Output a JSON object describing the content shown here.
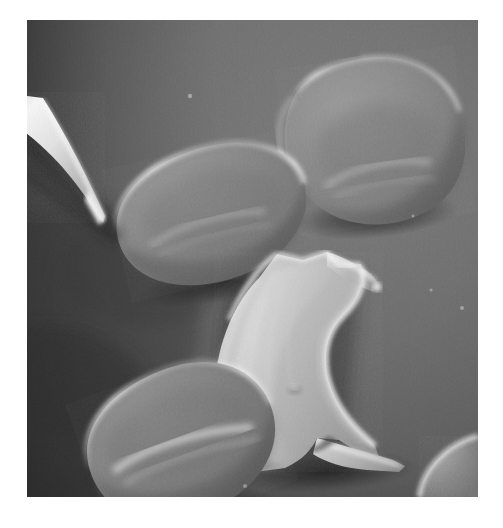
{
  "image": {
    "kind": "scanning-electron-micrograph",
    "subject": "human red blood cells with one sickled erythrocyte",
    "background_color": "#6e6e6e",
    "page_background": "#ffffff",
    "plate": {
      "left": 27,
      "top": 20,
      "width": 451,
      "height": 477
    },
    "tone": {
      "background_light": "#7a7a7a",
      "background_mid": "#6a6a6a",
      "background_dark": "#3a3a3a",
      "cell_mid": "#8a8a8a",
      "cell_highlight": "#d8d8d8",
      "cell_shadow": "#3c3c3c",
      "sickle_body": "#b8b8b8",
      "sickle_highlight": "#ededed",
      "probe_highlight": "#f2f2f2"
    },
    "objects": [
      {
        "name": "red-blood-cell-top-right",
        "type": "biconcave-disc",
        "cx": 345,
        "cy": 120,
        "rx": 88,
        "ry": 80,
        "rotation": -8
      },
      {
        "name": "red-blood-cell-middle-left",
        "type": "biconcave-disc",
        "cx": 183,
        "cy": 195,
        "rx": 93,
        "ry": 68,
        "rotation": -14
      },
      {
        "name": "red-blood-cell-bottom-left",
        "type": "biconcave-disc",
        "cx": 155,
        "cy": 420,
        "rx": 86,
        "ry": 72,
        "rotation": -22
      },
      {
        "name": "red-blood-cell-bottom-right-partial",
        "type": "biconcave-disc",
        "cx": 500,
        "cy": 520,
        "rx": 80,
        "ry": 66,
        "rotation": -30
      },
      {
        "name": "sickle-cell",
        "type": "crescent",
        "cx": 278,
        "cy": 350,
        "opening": "right",
        "tip_upper": [
          353,
          267
        ],
        "tip_lower": [
          375,
          440
        ]
      },
      {
        "name": "probe-needle",
        "type": "cone",
        "from": [
          27,
          110
        ],
        "to": [
          101,
          222
        ]
      }
    ]
  }
}
